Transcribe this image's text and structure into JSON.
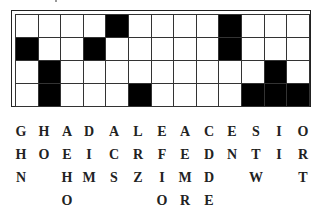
{
  "puzzle": {
    "type": "fallen-phrase",
    "rows": 4,
    "cols": 13,
    "black_cells": [
      [
        0,
        4
      ],
      [
        0,
        9
      ],
      [
        1,
        0
      ],
      [
        1,
        3
      ],
      [
        1,
        9
      ],
      [
        2,
        1
      ],
      [
        2,
        11
      ],
      [
        3,
        1
      ],
      [
        3,
        5
      ],
      [
        3,
        10
      ],
      [
        3,
        11
      ],
      [
        3,
        12
      ]
    ],
    "letter_columns": [
      [
        "G",
        "H",
        "N",
        ""
      ],
      [
        "H",
        "O",
        "",
        ""
      ],
      [
        "A",
        "E",
        "H",
        "O"
      ],
      [
        "D",
        "I",
        "M",
        ""
      ],
      [
        "A",
        "C",
        "S",
        ""
      ],
      [
        "L",
        "R",
        "Z",
        ""
      ],
      [
        "E",
        "F",
        "I",
        "O"
      ],
      [
        "A",
        "E",
        "M",
        "R"
      ],
      [
        "C",
        "D",
        "D",
        "E"
      ],
      [
        "E",
        "N",
        "",
        ""
      ],
      [
        "S",
        "T",
        "W",
        ""
      ],
      [
        "I",
        "I",
        "",
        ""
      ],
      [
        "O",
        "R",
        "T",
        ""
      ]
    ]
  },
  "colors": {
    "black_cell": "#000000",
    "white_cell": "#ffffff",
    "grid_line": "#333333",
    "text": "#222222"
  }
}
